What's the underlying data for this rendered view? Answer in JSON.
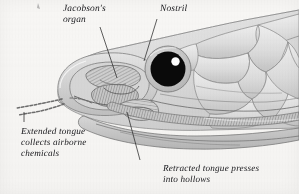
{
  "figure": {
    "background_color": "#f7f6f4",
    "ink_color": "#16161a",
    "scale_fill": "#dcdcdc",
    "scale_outline": "#8c8c8c",
    "eye_color": "#0a0a0a",
    "eye_highlight_color": "#ffffff",
    "eye_ring_color": "#c9c9c9",
    "organ_shading_color": "#a9a9a9"
  },
  "labels": {
    "jacobson": {
      "line1": "Jacobson's",
      "line2": "organ",
      "leader": "line-to-jacobsons-organ"
    },
    "nostril": {
      "line1": "Nostril",
      "leader": "line-to-nostril"
    },
    "extended_tongue": {
      "line1": "Extended tongue",
      "line2": "collects airborne",
      "line3": "chemicals",
      "leader": "line-to-extended-tongue"
    },
    "retracted_tongue": {
      "line1": "Retracted tongue presses",
      "line2": "into hollows",
      "leader": "line-to-retracted-tongue"
    }
  }
}
